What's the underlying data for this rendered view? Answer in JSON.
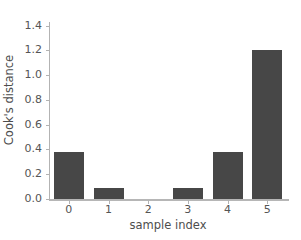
{
  "chart_data": {
    "type": "bar",
    "title": "",
    "xlabel": "sample index",
    "ylabel": "Cook's distance",
    "categories": [
      "0",
      "1",
      "2",
      "3",
      "4",
      "5"
    ],
    "values": [
      0.378,
      0.09,
      0.0,
      0.09,
      0.38,
      1.205
    ],
    "ylim": [
      0.0,
      1.43
    ],
    "yticks": [
      "0.0",
      "0.2",
      "0.4",
      "0.6",
      "0.8",
      "1.0",
      "1.2",
      "1.4"
    ],
    "ytick_values": [
      0.0,
      0.2,
      0.4,
      0.6,
      0.8,
      1.0,
      1.2,
      1.4
    ],
    "xtick_values": [
      0,
      1,
      2,
      3,
      4,
      5
    ],
    "grid": false,
    "legend": null,
    "bar_color": "#474747",
    "axis_color": "#b3b3b3",
    "tick_label_color": "#555555",
    "axis_label_color": "#4d4d4d",
    "background_color": "#ffffff"
  }
}
